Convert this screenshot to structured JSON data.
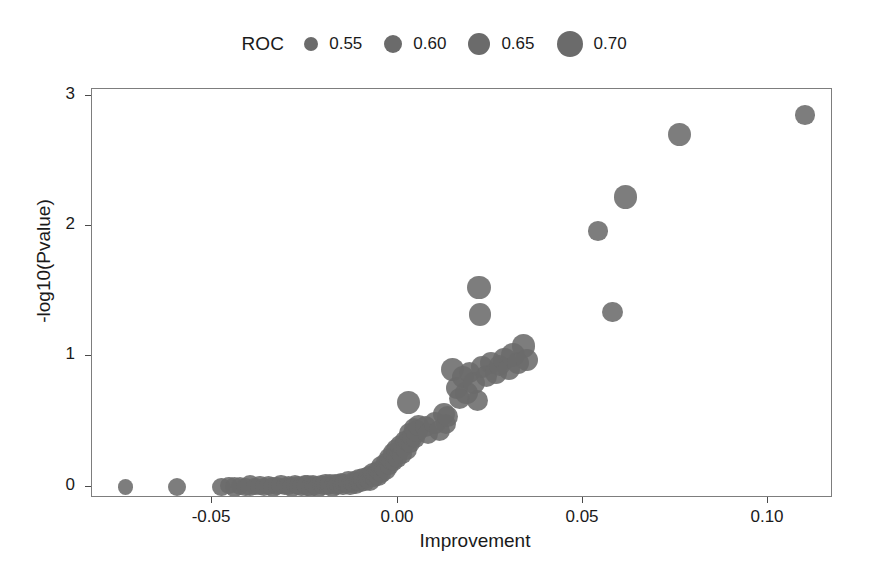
{
  "chart_data": {
    "type": "scatter",
    "title": "",
    "xlabel": "Improvement",
    "ylabel": "-log10(Pvalue)",
    "xlim": [
      -0.0825,
      0.1175
    ],
    "ylim": [
      -0.085,
      3.05
    ],
    "xticks": [
      -0.05,
      0.0,
      0.05,
      0.1
    ],
    "xticklabels": [
      "-0.05",
      "0.00",
      "0.05",
      "0.10"
    ],
    "yticks": [
      0,
      1,
      2,
      3
    ],
    "yticklabels": [
      "0",
      "1",
      "2",
      "3"
    ],
    "grid": false,
    "point_color": "#6b6b6b",
    "size_encoding": "ROC",
    "legend": {
      "position": "top-center",
      "title": "ROC",
      "entries": [
        {
          "label": "0.55",
          "value": 0.55,
          "radius_px": 7
        },
        {
          "label": "0.60",
          "value": 0.6,
          "radius_px": 9
        },
        {
          "label": "0.65",
          "value": 0.65,
          "radius_px": 11
        },
        {
          "label": "0.70",
          "value": 0.7,
          "radius_px": 13
        }
      ]
    },
    "series": [
      {
        "name": "biomarkers",
        "fields": [
          "improvement",
          "neglog10p",
          "roc"
        ],
        "points": [
          [
            -0.0735,
            0.0,
            0.57
          ],
          [
            -0.0595,
            0.0,
            0.6
          ],
          [
            -0.0475,
            0.0,
            0.61
          ],
          [
            -0.0455,
            0.01,
            0.59
          ],
          [
            -0.044,
            0.0,
            0.62
          ],
          [
            -0.0425,
            0.01,
            0.6
          ],
          [
            -0.041,
            0.0,
            0.61
          ],
          [
            -0.0398,
            0.01,
            0.63
          ],
          [
            -0.0385,
            0.0,
            0.59
          ],
          [
            -0.0372,
            0.01,
            0.62
          ],
          [
            -0.036,
            0.0,
            0.6
          ],
          [
            -0.0348,
            0.01,
            0.61
          ],
          [
            -0.0337,
            0.0,
            0.63
          ],
          [
            -0.0325,
            0.01,
            0.6
          ],
          [
            -0.0315,
            0.02,
            0.62
          ],
          [
            -0.0305,
            0.0,
            0.59
          ],
          [
            -0.0295,
            0.01,
            0.61
          ],
          [
            -0.0285,
            0.0,
            0.63
          ],
          [
            -0.0276,
            0.02,
            0.6
          ],
          [
            -0.0268,
            0.01,
            0.62
          ],
          [
            -0.0259,
            0.0,
            0.61
          ],
          [
            -0.0251,
            0.02,
            0.6
          ],
          [
            -0.0243,
            0.01,
            0.63
          ],
          [
            -0.0235,
            0.0,
            0.62
          ],
          [
            -0.0228,
            0.02,
            0.6
          ],
          [
            -0.0221,
            0.01,
            0.61
          ],
          [
            -0.0214,
            0.0,
            0.63
          ],
          [
            -0.0207,
            0.02,
            0.6
          ],
          [
            -0.02,
            0.01,
            0.62
          ],
          [
            -0.0194,
            0.03,
            0.61
          ],
          [
            -0.0188,
            0.01,
            0.6
          ],
          [
            -0.0182,
            0.02,
            0.63
          ],
          [
            -0.0176,
            0.0,
            0.62
          ],
          [
            -0.017,
            0.03,
            0.6
          ],
          [
            -0.0165,
            0.01,
            0.61
          ],
          [
            -0.0159,
            0.02,
            0.63
          ],
          [
            -0.0154,
            0.04,
            0.6
          ],
          [
            -0.0148,
            0.01,
            0.62
          ],
          [
            -0.0143,
            0.03,
            0.61
          ],
          [
            -0.0138,
            0.02,
            0.6
          ],
          [
            -0.0133,
            0.04,
            0.63
          ],
          [
            -0.0128,
            0.01,
            0.62
          ],
          [
            -0.0123,
            0.03,
            0.6
          ],
          [
            -0.0118,
            0.05,
            0.61
          ],
          [
            -0.0114,
            0.02,
            0.63
          ],
          [
            -0.0109,
            0.04,
            0.6
          ],
          [
            -0.0105,
            0.06,
            0.62
          ],
          [
            -0.01,
            0.03,
            0.61
          ],
          [
            -0.0096,
            0.05,
            0.6
          ],
          [
            -0.0092,
            0.07,
            0.63
          ],
          [
            -0.0087,
            0.04,
            0.62
          ],
          [
            -0.0083,
            0.06,
            0.6
          ],
          [
            -0.0079,
            0.09,
            0.61
          ],
          [
            -0.0075,
            0.05,
            0.63
          ],
          [
            -0.0071,
            0.08,
            0.6
          ],
          [
            -0.0067,
            0.11,
            0.62
          ],
          [
            -0.0063,
            0.07,
            0.61
          ],
          [
            -0.0059,
            0.1,
            0.63
          ],
          [
            -0.0056,
            0.13,
            0.6
          ],
          [
            -0.0052,
            0.08,
            0.62
          ],
          [
            -0.0048,
            0.12,
            0.61
          ],
          [
            -0.0045,
            0.16,
            0.63
          ],
          [
            -0.0041,
            0.1,
            0.6
          ],
          [
            -0.0038,
            0.15,
            0.62
          ],
          [
            -0.0034,
            0.19,
            0.61
          ],
          [
            -0.0031,
            0.13,
            0.63
          ],
          [
            -0.0027,
            0.18,
            0.6
          ],
          [
            -0.0024,
            0.22,
            0.62
          ],
          [
            -0.0021,
            0.16,
            0.61
          ],
          [
            -0.0017,
            0.21,
            0.63
          ],
          [
            -0.0014,
            0.26,
            0.62
          ],
          [
            -0.0011,
            0.19,
            0.6
          ],
          [
            -0.0007,
            0.24,
            0.61
          ],
          [
            -0.0004,
            0.29,
            0.63
          ],
          [
            0.0,
            0.22,
            0.62
          ],
          [
            0.0004,
            0.27,
            0.61
          ],
          [
            0.0007,
            0.32,
            0.64
          ],
          [
            0.0011,
            0.25,
            0.62
          ],
          [
            0.0015,
            0.31,
            0.63
          ],
          [
            0.0019,
            0.36,
            0.61
          ],
          [
            0.0023,
            0.29,
            0.64
          ],
          [
            0.0027,
            0.35,
            0.62
          ],
          [
            0.0031,
            0.41,
            0.63
          ],
          [
            0.0035,
            0.33,
            0.61
          ],
          [
            0.004,
            0.39,
            0.64
          ],
          [
            0.0044,
            0.45,
            0.63
          ],
          [
            0.0048,
            0.37,
            0.62
          ],
          [
            0.0052,
            0.43,
            0.65
          ],
          [
            0.0056,
            0.47,
            0.63
          ],
          [
            0.003,
            0.65,
            0.66
          ],
          [
            0.0075,
            0.46,
            0.64
          ],
          [
            0.0082,
            0.41,
            0.63
          ],
          [
            0.01,
            0.49,
            0.65
          ],
          [
            0.0112,
            0.43,
            0.64
          ],
          [
            0.0125,
            0.56,
            0.65
          ],
          [
            0.013,
            0.48,
            0.63
          ],
          [
            0.0135,
            0.54,
            0.64
          ],
          [
            0.0148,
            0.9,
            0.66
          ],
          [
            0.016,
            0.76,
            0.65
          ],
          [
            0.0168,
            0.68,
            0.64
          ],
          [
            0.0175,
            0.84,
            0.65
          ],
          [
            0.0185,
            0.72,
            0.66
          ],
          [
            0.0195,
            0.88,
            0.64
          ],
          [
            0.0205,
            0.8,
            0.65
          ],
          [
            0.0215,
            0.66,
            0.64
          ],
          [
            0.022,
            1.53,
            0.67
          ],
          [
            0.0222,
            1.32,
            0.66
          ],
          [
            0.0228,
            0.92,
            0.65
          ],
          [
            0.024,
            0.85,
            0.64
          ],
          [
            0.0252,
            0.95,
            0.66
          ],
          [
            0.0265,
            0.87,
            0.65
          ],
          [
            0.0275,
            0.93,
            0.64
          ],
          [
            0.0288,
            0.98,
            0.66
          ],
          [
            0.03,
            0.9,
            0.65
          ],
          [
            0.0312,
            1.01,
            0.67
          ],
          [
            0.0325,
            0.95,
            0.66
          ],
          [
            0.034,
            1.08,
            0.67
          ],
          [
            0.035,
            0.97,
            0.65
          ],
          [
            0.054,
            1.96,
            0.62
          ],
          [
            0.058,
            1.34,
            0.63
          ],
          [
            0.0615,
            2.22,
            0.67
          ],
          [
            0.076,
            2.7,
            0.66
          ],
          [
            0.11,
            2.85,
            0.62
          ]
        ]
      }
    ]
  }
}
